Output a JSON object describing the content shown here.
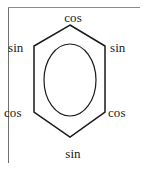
{
  "figure": {
    "kind": "hexagon-ring-diagram",
    "background_color": "#ffffff",
    "stroke_color": "#1a1a1a",
    "text_color": "#1a1a1a",
    "border_color": "#6f6f6f"
  },
  "crop_borders": {
    "left_rule_visible": "true",
    "top_rule_visible": "true",
    "right_rule_visible": "false",
    "bottom_rule_visible": "false"
  },
  "ring": {
    "shape": "hexagon",
    "orientation": "pointy-top",
    "inner_shape": "ellipse",
    "vertices": [
      {
        "name": "top",
        "x": 70,
        "y": 25
      },
      {
        "name": "upper-right",
        "x": 105,
        "y": 46
      },
      {
        "name": "lower-right",
        "x": 105,
        "y": 112
      },
      {
        "name": "bottom",
        "x": 70,
        "y": 137
      },
      {
        "name": "lower-left",
        "x": 34,
        "y": 112
      },
      {
        "name": "upper-left",
        "x": 34,
        "y": 46
      }
    ],
    "ellipse": {
      "cx": 70,
      "cy": 80,
      "rx": 26,
      "ry": 36
    }
  },
  "labels": {
    "top": "cos",
    "upper_left": "sin",
    "upper_right": "sin",
    "lower_left": "cos",
    "lower_right": "cos",
    "bottom": "sin"
  }
}
